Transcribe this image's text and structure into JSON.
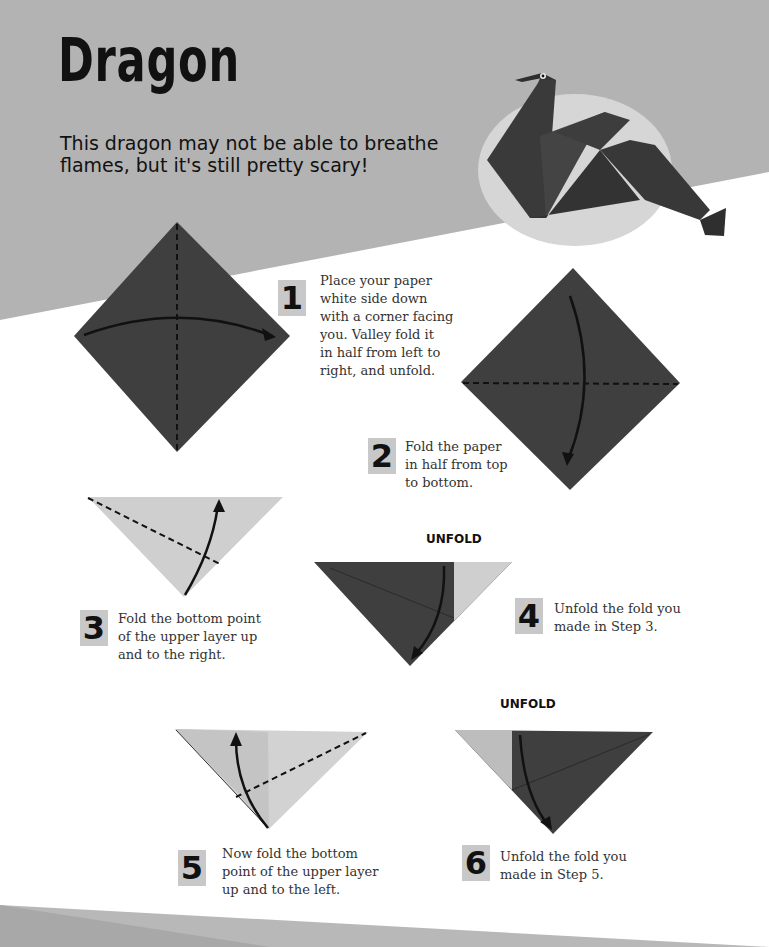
{
  "page": {
    "title": "Dragon",
    "subtitle": "This dragon may not be able to breathe flames, but it's still pretty scary!",
    "colors": {
      "header_band": "#b3b3b3",
      "paper_dark": "#3f3f3f",
      "paper_light": "#cfcfcf",
      "badge": "#c8c8c8",
      "text": "#333333",
      "ellipse": "#d6d6d6"
    }
  },
  "hero_image": {
    "alt": "Finished origami dragon"
  },
  "steps": [
    {
      "number": "1",
      "text": "Place your paper white side down with a corner facing you. Valley fold it in half from left to right, and unfold.",
      "lines": [
        "Place your paper",
        "white side down",
        "with a corner facing",
        "you. Valley fold it",
        "in half from left to",
        "right, and unfold."
      ]
    },
    {
      "number": "2",
      "text": "Fold the paper in half from top to bottom.",
      "lines": [
        "Fold the paper",
        "in half from top",
        "to bottom."
      ]
    },
    {
      "number": "3",
      "text": "Fold the bottom point of the upper layer up and to the right.",
      "lines": [
        "Fold the bottom point",
        "of the upper layer up",
        "and to the right."
      ]
    },
    {
      "number": "4",
      "text": "Unfold the fold you made in Step 3.",
      "lines": [
        "Unfold the fold you",
        "made in Step 3."
      ],
      "label": "UNFOLD"
    },
    {
      "number": "5",
      "text": "Now fold the bottom point of the upper layer up and to the left.",
      "lines": [
        "Now fold the bottom",
        "point of the upper layer",
        "up and to the left."
      ]
    },
    {
      "number": "6",
      "text": "Unfold the fold you made in Step 5.",
      "lines": [
        "Unfold the fold you",
        "made in Step 5."
      ],
      "label": "UNFOLD"
    }
  ]
}
